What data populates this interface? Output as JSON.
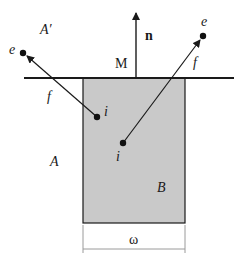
{
  "diagram": {
    "labels": {
      "normal": "n",
      "point_m": "M",
      "region_a_prime": "A′",
      "region_a": "A",
      "region_b": "B",
      "width": "ω",
      "left_emission": "e",
      "left_interior": "i",
      "left_flux": "f",
      "right_emission": "e",
      "right_interior": "i",
      "right_flux": "f"
    },
    "colors": {
      "line": "#1a1a1a",
      "region_b_fill": "#c9c9c9",
      "dimension_line": "#9a9a9a"
    }
  }
}
